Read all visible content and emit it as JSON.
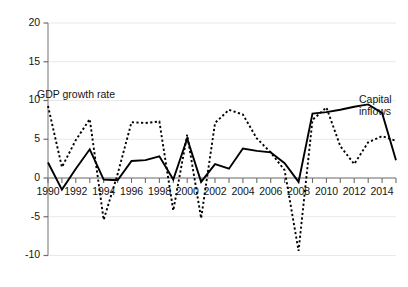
{
  "chart_data": {
    "type": "line",
    "title": "",
    "subtitle": "",
    "xlabel": "",
    "ylabel": "",
    "xlim": [
      1990,
      2015
    ],
    "ylim": [
      -10,
      20
    ],
    "y_ticks": [
      20,
      15,
      10,
      5,
      0,
      -5,
      -10
    ],
    "y_tick_labels": [
      "20",
      "15",
      "10",
      "5",
      "0",
      "-5",
      "-10"
    ],
    "x_ticks": [
      1990,
      1991,
      1992,
      1993,
      1994,
      1995,
      1996,
      1997,
      1998,
      1999,
      2000,
      2001,
      2002,
      2003,
      2004,
      2005,
      2006,
      2007,
      2008,
      2009,
      2010,
      2011,
      2012,
      2013,
      2014,
      2015
    ],
    "x_tick_labels": [
      "1990",
      "1992",
      "1994",
      "1996",
      "1998",
      "2000",
      "2002",
      "2004",
      "2006",
      "2008",
      "2010",
      "2012",
      "2014"
    ],
    "x_labeled_ticks": [
      1990,
      1992,
      1994,
      1996,
      1998,
      2000,
      2002,
      2004,
      2006,
      2008,
      2010,
      2012,
      2014
    ],
    "grid": true,
    "grid_axis": "y",
    "legend_position": "inline-annotations",
    "x": [
      1990,
      1991,
      1992,
      1993,
      1994,
      1995,
      1996,
      1997,
      1998,
      1999,
      2000,
      2001,
      2002,
      2003,
      2004,
      2005,
      2006,
      2007,
      2008,
      2009,
      2010,
      2011,
      2012,
      2013,
      2014,
      2015
    ],
    "series": [
      {
        "name": "GDP growth rate",
        "style": "solid",
        "color": "#000000",
        "values": [
          2.0,
          -1.5,
          1.2,
          3.7,
          -0.2,
          -0.3,
          2.2,
          2.3,
          2.8,
          -0.2,
          5.1,
          -0.5,
          1.8,
          1.2,
          3.8,
          3.5,
          3.3,
          1.9,
          -0.5,
          8.3,
          8.5,
          8.8,
          9.2,
          9.5,
          8.4,
          2.3
        ]
      },
      {
        "name": "Capital inflows",
        "style": "dotted",
        "color": "#000000",
        "values": [
          9.3,
          1.4,
          4.9,
          7.6,
          -5.4,
          0.5,
          7.2,
          7.1,
          7.3,
          -4.2,
          5.6,
          -5.2,
          7.1,
          8.8,
          8.2,
          5.1,
          3.3,
          1.0,
          -9.4,
          7.5,
          9.1,
          4.1,
          1.8,
          4.6,
          5.4,
          4.8
        ]
      }
    ],
    "annotations": [
      {
        "text": "GDP growth rate",
        "x": 1990.4,
        "y": 11.2
      },
      {
        "text": "Capital inflows",
        "x": 2014.2,
        "y": 10.4
      }
    ]
  },
  "axes": {
    "y_labels": [
      "20",
      "15",
      "10",
      "5",
      "0",
      "-5",
      "-10"
    ],
    "x_labels": [
      "1990",
      "1992",
      "1994",
      "1996",
      "1998",
      "2000",
      "2002",
      "2004",
      "2006",
      "2008",
      "2010",
      "2012",
      "2014"
    ]
  },
  "labels": {
    "gdp_growth_rate": "GDP growth rate",
    "capital_inflows_line1": "Capital",
    "capital_inflows_line2": "inflows"
  },
  "colors": {
    "axis": "#8c8c8c",
    "grid": "#e4e4e4",
    "series": "#000000",
    "text": "#141414",
    "background": "#ffffff"
  }
}
